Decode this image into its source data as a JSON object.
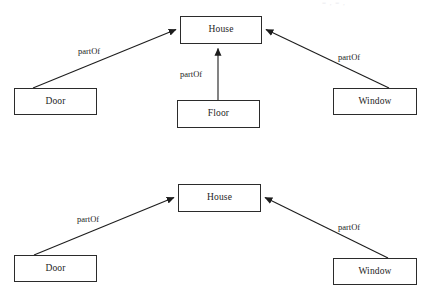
{
  "page": {
    "width": 431,
    "height": 296,
    "background": "#ffffff",
    "ink": "#1d1d1d",
    "stroke": "#2b2b2b",
    "corner_artifact": "= , = ,"
  },
  "diagrams": [
    {
      "id": "diagram-top",
      "relation": "partOf",
      "nodes": [
        {
          "id": "house-top",
          "label": "House",
          "x": 180,
          "y": 16,
          "w": 82,
          "h": 28
        },
        {
          "id": "door-top",
          "label": "Door",
          "x": 14,
          "y": 88,
          "w": 83,
          "h": 27
        },
        {
          "id": "floor-top",
          "label": "Floor",
          "x": 177,
          "y": 100,
          "w": 83,
          "h": 28
        },
        {
          "id": "window-top",
          "label": "Window",
          "x": 333,
          "y": 88,
          "w": 84,
          "h": 27
        }
      ],
      "edges": [
        {
          "id": "door-partof-house-top",
          "from": "door-top",
          "to": "house-top",
          "label": "partOf",
          "label_x": 78,
          "label_y": 47
        },
        {
          "id": "floor-partof-house-top",
          "from": "floor-top",
          "to": "house-top",
          "label": "partOf",
          "label_x": 180,
          "label_y": 70
        },
        {
          "id": "window-partof-house-top",
          "from": "window-top",
          "to": "house-top",
          "label": "partOf",
          "label_x": 338,
          "label_y": 53
        }
      ]
    },
    {
      "id": "diagram-bottom",
      "relation": "partOf",
      "nodes": [
        {
          "id": "house-bottom",
          "label": "House",
          "x": 178,
          "y": 184,
          "w": 83,
          "h": 28
        },
        {
          "id": "door-bottom",
          "label": "Door",
          "x": 14,
          "y": 255,
          "w": 83,
          "h": 27
        },
        {
          "id": "window-bottom",
          "label": "Window",
          "x": 333,
          "y": 258,
          "w": 84,
          "h": 27
        }
      ],
      "edges": [
        {
          "id": "door-partof-house-bottom",
          "from": "door-bottom",
          "to": "house-bottom",
          "label": "partOf",
          "label_x": 77,
          "label_y": 215
        },
        {
          "id": "window-partof-house-bottom",
          "from": "window-bottom",
          "to": "house-bottom",
          "label": "partOf",
          "label_x": 338,
          "label_y": 223
        }
      ]
    }
  ]
}
